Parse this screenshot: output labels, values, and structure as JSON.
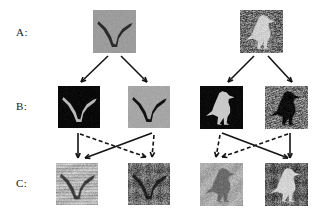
{
  "figure": {
    "title": "",
    "rows": [
      {
        "label": "A:",
        "label_x": 16,
        "label_y": 26,
        "role": "query-images",
        "items": [
          {
            "name": "bird-in-flight-query",
            "x": 93,
            "y": 10,
            "w": 43,
            "h": 43,
            "style": "grey-flat-background",
            "bg": "#9c9c9c",
            "fg": "#2b2b2b",
            "subject": "flying-bird",
            "texture": "smooth"
          },
          {
            "name": "perched-bird-query",
            "x": 240,
            "y": 10,
            "w": 43,
            "h": 43,
            "style": "natural-ground-texture",
            "bg": "#6e6e6e",
            "fg": "#cfcfcf",
            "subject": "standing-bird",
            "texture": "grass"
          }
        ]
      },
      {
        "label": "B:",
        "label_x": 16,
        "label_y": 106,
        "role": "segmentation-masks",
        "items": [
          {
            "name": "flight-mask-inverted",
            "x": 58,
            "y": 86,
            "w": 42,
            "h": 42,
            "style": "black-background-light-subject",
            "bg": "#090909",
            "fg": "#b9b9b9",
            "subject": "flying-bird",
            "texture": "smooth"
          },
          {
            "name": "flight-silhouette",
            "x": 128,
            "y": 86,
            "w": 42,
            "h": 42,
            "style": "grey-background-black-silhouette",
            "bg": "#a6a6a6",
            "fg": "#111111",
            "subject": "flying-bird",
            "texture": "smooth"
          },
          {
            "name": "perched-mask-inverted",
            "x": 200,
            "y": 86,
            "w": 43,
            "h": 43,
            "style": "black-background-light-subject",
            "bg": "#0a0a0a",
            "fg": "#c8c8c8",
            "subject": "standing-bird",
            "texture": "smooth"
          },
          {
            "name": "perched-silhouette",
            "x": 265,
            "y": 86,
            "w": 43,
            "h": 43,
            "style": "textured-background-black-silhouette",
            "bg": "#777777",
            "fg": "#0d0d0d",
            "subject": "standing-bird",
            "texture": "grass"
          }
        ]
      },
      {
        "label": "C:",
        "label_x": 16,
        "label_y": 183,
        "role": "retrieved-images",
        "items": [
          {
            "name": "retrieved-flying-bird-light",
            "x": 56,
            "y": 163,
            "w": 42,
            "h": 42,
            "style": "light-streaked-background",
            "bg": "#b5b5b5",
            "fg": "#3a3a3a",
            "subject": "flying-bird",
            "texture": "streaks"
          },
          {
            "name": "retrieved-flying-bird-dark",
            "x": 128,
            "y": 163,
            "w": 42,
            "h": 42,
            "style": "dark-mottled-background",
            "bg": "#6b6b6b",
            "fg": "#1e1e1e",
            "subject": "flying-bird",
            "texture": "mottled"
          },
          {
            "name": "retrieved-perched-bird-pale",
            "x": 200,
            "y": 163,
            "w": 43,
            "h": 43,
            "style": "pale-grey-background",
            "bg": "#a9a9a9",
            "fg": "#6a6a6a",
            "subject": "standing-bird",
            "texture": "soft"
          },
          {
            "name": "retrieved-perched-bird-contrast",
            "x": 265,
            "y": 163,
            "w": 43,
            "h": 43,
            "style": "high-contrast-background",
            "bg": "#5e5e5e",
            "fg": "#d2d2d2",
            "subject": "standing-bird",
            "texture": "mottled"
          }
        ]
      }
    ],
    "arrows": {
      "solid_color": "#141414",
      "dashed_color": "#141414",
      "stroke_width": 1.6,
      "dash_pattern": "4 2.6",
      "a_to_b": [
        {
          "name": "arrow-a1-to-b1",
          "x1": 108,
          "y1": 56,
          "x2": 81,
          "y2": 82,
          "style": "solid"
        },
        {
          "name": "arrow-a1-to-b2",
          "x1": 121,
          "y1": 56,
          "x2": 147,
          "y2": 82,
          "style": "solid"
        },
        {
          "name": "arrow-a2-to-b3",
          "x1": 254,
          "y1": 56,
          "x2": 228,
          "y2": 82,
          "style": "solid"
        },
        {
          "name": "arrow-a2-to-b4",
          "x1": 268,
          "y1": 56,
          "x2": 292,
          "y2": 82,
          "style": "solid"
        }
      ],
      "b_to_c": [
        {
          "name": "arrow-b1-to-c1-solid",
          "x1": 78,
          "y1": 133,
          "x2": 78,
          "y2": 158,
          "style": "solid"
        },
        {
          "name": "arrow-b2-to-c1-solid",
          "x1": 152,
          "y1": 133,
          "x2": 85,
          "y2": 158,
          "style": "solid"
        },
        {
          "name": "arrow-b3-to-c4-solid",
          "x1": 222,
          "y1": 133,
          "x2": 288,
          "y2": 158,
          "style": "solid"
        },
        {
          "name": "arrow-b4-to-c4-solid",
          "x1": 290,
          "y1": 133,
          "x2": 290,
          "y2": 158,
          "style": "solid"
        },
        {
          "name": "arrow-b1-to-c2-dashed",
          "x1": 80,
          "y1": 134,
          "x2": 146,
          "y2": 157,
          "style": "dashed"
        },
        {
          "name": "arrow-b2-to-c2-dashed",
          "x1": 154,
          "y1": 135,
          "x2": 152,
          "y2": 157,
          "style": "dashed"
        },
        {
          "name": "arrow-b3-to-c3-dashed",
          "x1": 220,
          "y1": 135,
          "x2": 216,
          "y2": 157,
          "style": "dashed"
        },
        {
          "name": "arrow-b4-to-c3-dashed",
          "x1": 288,
          "y1": 134,
          "x2": 222,
          "y2": 157,
          "style": "dashed"
        }
      ]
    }
  }
}
